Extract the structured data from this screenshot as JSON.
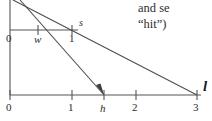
{
  "figure": {
    "caption_fragments": [
      "and se",
      "“hit”)"
    ],
    "axis_name": "l",
    "vertical_axis": {
      "name": "vertical-axis",
      "x": 10,
      "y_top": 0,
      "y_bottom": 95
    },
    "upper_axis": {
      "name": "upper-axis",
      "y": 30,
      "x_start": 10,
      "x_end": 78,
      "origin_label": "0",
      "end_point_label": "s",
      "ticks": [
        {
          "label": "w",
          "x": 38,
          "italic": true
        },
        {
          "label": "1",
          "x": 72,
          "italic": false
        }
      ]
    },
    "lower_axis": {
      "name": "lower-axis",
      "y": 95,
      "x_start": 10,
      "x_end": 201,
      "ticks": [
        {
          "label": "0",
          "x": 10,
          "italic": false
        },
        {
          "label": "1",
          "x": 72,
          "italic": false
        },
        {
          "label": "h",
          "x": 104,
          "italic": true
        },
        {
          "label": "2",
          "x": 136,
          "italic": false
        },
        {
          "label": "3",
          "x": 197,
          "italic": false
        }
      ]
    },
    "rays": [
      {
        "name": "shallow-ray",
        "from": [
          13,
          0
        ],
        "to": [
          197,
          95
        ],
        "arrowhead": false
      },
      {
        "name": "steep-ray-with-arrow",
        "from": [
          20,
          0
        ],
        "to": [
          104,
          95
        ],
        "arrowhead": true
      }
    ],
    "colors": {
      "line": "#4a4a4a",
      "axis": "#555555",
      "text": "#2b2b2b",
      "background": "#ffffff"
    }
  }
}
